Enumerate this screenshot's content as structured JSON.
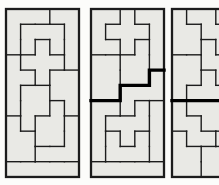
{
  "figure": {
    "kind": "pentomino-tiling-diagram",
    "canvas": {
      "width": 219,
      "height": 185
    },
    "background": "#fcfcfa"
  },
  "style": {
    "cell_fill": "#e9e9e5",
    "line_color": "#1c1c1c",
    "bold_color": "#000000",
    "thin_width": 1.4,
    "border_width": 2.3,
    "bold_width": 3.4
  },
  "grid": {
    "cols": 5,
    "rows": 11,
    "cell_w": 14.6,
    "cell_h": 15.27,
    "top": 9
  },
  "panels": [
    {
      "id": "panel-1",
      "x": 6,
      "right_cropped": false,
      "map": [
        "AAABB",
        "ACCCB",
        "ACDCB",
        "EDDDB",
        "EEDFF",
        "EGGFF",
        "EGGHF",
        "IGHHJ",
        "IIHHJ",
        "IIJJJ",
        "KKKKK"
      ],
      "bold_path": []
    },
    {
      "id": "panel-2",
      "x": 91,
      "right_cropped": false,
      "map": [
        "AAXBB",
        "AXXXB",
        "AAXCB",
        "DDCCB",
        "DDCCE",
        "DDEEE",
        "FFEHJ",
        "FHHHJ",
        "FGHGJ",
        "FGGGJ",
        "KKKKK"
      ],
      "bold_path": [
        [
          0,
          6
        ],
        [
          2,
          6
        ],
        [
          2,
          5
        ],
        [
          4,
          5
        ],
        [
          4,
          4
        ],
        [
          5,
          4
        ]
      ]
    },
    {
      "id": "panel-3",
      "x": 172,
      "right_cropped": true,
      "map": [
        "ABBCC",
        "AABBC",
        "AADBC",
        "EEDDC",
        "EEFDD",
        "EFFFF",
        "GHHHI",
        "GGHHI",
        "JGGII",
        "JJKKI",
        "JJKKK"
      ],
      "bold_path": [
        [
          0,
          6
        ],
        [
          5,
          6
        ]
      ]
    }
  ]
}
